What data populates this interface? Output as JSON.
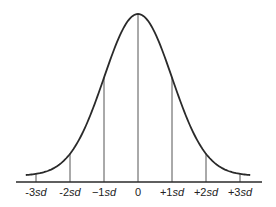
{
  "diagram": {
    "colors": {
      "curve": "#2a2a2a",
      "lines": "#555555",
      "text": "#222222",
      "background": "#ffffff"
    },
    "x_range_sd": [
      -3.3,
      3.3
    ],
    "markers": [
      {
        "sd": -3,
        "sign": "-",
        "num": "3",
        "unit": "sd"
      },
      {
        "sd": -2,
        "sign": "-",
        "num": "2",
        "unit": "sd"
      },
      {
        "sd": -1,
        "sign": "−",
        "num": "1",
        "unit": "sd"
      },
      {
        "sd": 0,
        "sign": "",
        "num": "0",
        "unit": ""
      },
      {
        "sd": 1,
        "sign": "+",
        "num": "1",
        "unit": "sd"
      },
      {
        "sd": 2,
        "sign": "+",
        "num": "2",
        "unit": "sd"
      },
      {
        "sd": 3,
        "sign": "+",
        "num": "3",
        "unit": "sd"
      }
    ]
  }
}
